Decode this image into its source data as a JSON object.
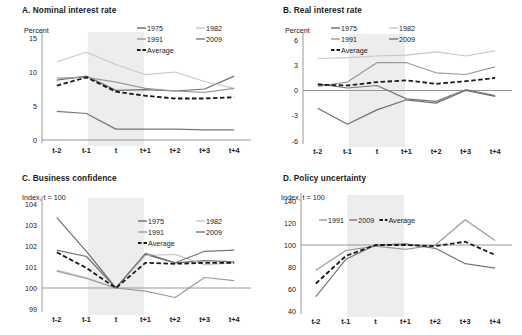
{
  "figure": {
    "xcats": [
      "t-2",
      "t-1",
      "t",
      "t+1",
      "t+2",
      "t+3",
      "t+4"
    ],
    "shading_note": "light gray band around period t",
    "colors": {
      "c1975": "#6e6e6e",
      "c1991": "#9a9a9a",
      "c1982": "#c8c8c8",
      "c2009": "#767676",
      "caverage": "#1a1a1a",
      "axis": "#8c8c8c",
      "band": "#ededed"
    }
  },
  "panels": [
    {
      "id": "A",
      "title": "A. Nominal interest rate",
      "unit": "Percent",
      "ylim": [
        0,
        15
      ],
      "yticks": [
        "0",
        "5",
        "10",
        "15"
      ],
      "ytickvals": [
        0,
        5,
        10,
        15
      ],
      "legend": [
        "1975",
        "1982",
        "1991",
        "2009",
        "Average"
      ],
      "chart_data": {
        "type": "line",
        "title": "A. Nominal interest rate",
        "xlabel": "",
        "ylabel": "Percent",
        "ylim": [
          0,
          15
        ],
        "grid": false,
        "legend_position": "top-right",
        "x": [
          "t-2",
          "t-1",
          "t",
          "t+1",
          "t+2",
          "t+3",
          "t+4"
        ],
        "series": [
          {
            "name": "1975",
            "values": [
              8.8,
              9.4,
              7.3,
              7.4,
              7.2,
              7.5,
              9.4
            ]
          },
          {
            "name": "1982",
            "values": [
              11.5,
              12.9,
              11.1,
              9.6,
              10.0,
              8.6,
              7.6
            ]
          },
          {
            "name": "1991",
            "values": [
              9.1,
              9.2,
              8.5,
              7.6,
              7.2,
              7.0,
              7.6
            ]
          },
          {
            "name": "2009",
            "values": [
              4.2,
              3.9,
              1.6,
              1.6,
              1.6,
              1.5,
              1.5
            ]
          },
          {
            "name": "Average",
            "values": [
              8.0,
              9.2,
              7.1,
              6.5,
              6.1,
              6.1,
              6.3
            ]
          }
        ]
      }
    },
    {
      "id": "B",
      "title": "B. Real interest rate",
      "unit": "Percent",
      "ylim": [
        -6,
        6
      ],
      "yticks": [
        "-6",
        "-3",
        "0",
        "3",
        "6"
      ],
      "ytickvals": [
        -6,
        -3,
        0,
        3,
        6
      ],
      "legend": [
        "1975",
        "1982",
        "1991",
        "2009",
        "Average"
      ],
      "chart_data": {
        "type": "line",
        "title": "B. Real interest rate",
        "xlabel": "",
        "ylabel": "Percent",
        "ylim": [
          -6,
          6
        ],
        "grid": false,
        "legend_position": "top-left",
        "x": [
          "t-2",
          "t-1",
          "t",
          "t+1",
          "t+2",
          "t+3",
          "t+4"
        ],
        "series": [
          {
            "name": "1975",
            "values": [
              -2.1,
              -4.0,
              -2.3,
              -1.1,
              -1.5,
              0.0,
              -0.7
            ]
          },
          {
            "name": "1982",
            "values": [
              3.8,
              3.9,
              4.1,
              4.2,
              4.6,
              4.1,
              4.7
            ]
          },
          {
            "name": "1991",
            "values": [
              0.5,
              1.0,
              3.3,
              3.3,
              2.1,
              1.9,
              2.8
            ]
          },
          {
            "name": "2009",
            "values": [
              0.8,
              0.3,
              0.6,
              -1.0,
              -1.3,
              0.1,
              -0.6
            ]
          },
          {
            "name": "Average",
            "values": [
              0.7,
              0.6,
              1.0,
              1.2,
              0.8,
              1.1,
              1.5
            ]
          }
        ]
      }
    },
    {
      "id": "C",
      "title": "C. Business confidence",
      "unit": "Index, t = 100",
      "ylim": [
        99,
        104
      ],
      "yticks": [
        "99",
        "100",
        "101",
        "102",
        "103",
        "104"
      ],
      "ytickvals": [
        99,
        100,
        101,
        102,
        103,
        104
      ],
      "legend": [
        "1975",
        "1982",
        "1991",
        "2009",
        "Average"
      ],
      "chart_data": {
        "type": "line",
        "title": "C. Business confidence",
        "xlabel": "",
        "ylabel": "Index, t = 100",
        "ylim": [
          99,
          104
        ],
        "grid": false,
        "legend_position": "top-right",
        "x": [
          "t-2",
          "t-1",
          "t",
          "t+1",
          "t+2",
          "t+3",
          "t+4"
        ],
        "series": [
          {
            "name": "1975",
            "values": [
              103.35,
              101.75,
              100.0,
              101.6,
              101.2,
              101.3,
              101.25
            ]
          },
          {
            "name": "1982",
            "values": [
              100.85,
              100.5,
              100.0,
              101.55,
              101.6,
              101.1,
              101.2
            ]
          },
          {
            "name": "1991",
            "values": [
              100.8,
              100.45,
              100.0,
              99.85,
              99.55,
              100.5,
              100.35
            ]
          },
          {
            "name": "2009",
            "values": [
              101.8,
              101.5,
              100.0,
              101.65,
              101.2,
              101.75,
              101.8
            ]
          },
          {
            "name": "Average",
            "values": [
              101.7,
              100.95,
              100.0,
              101.2,
              101.15,
              101.2,
              101.2
            ]
          }
        ]
      }
    },
    {
      "id": "D",
      "title": "D. Policy uncertainty",
      "unit": "Index, t = 100",
      "ylim": [
        40,
        140
      ],
      "yticks": [
        "40",
        "60",
        "80",
        "100",
        "120",
        "140"
      ],
      "ytickvals": [
        40,
        60,
        80,
        100,
        120,
        140
      ],
      "legend": [
        "1991",
        "2009",
        "Average"
      ],
      "chart_data": {
        "type": "line",
        "title": "D. Policy uncertainty",
        "xlabel": "",
        "ylabel": "Index, t = 100",
        "ylim": [
          40,
          140
        ],
        "grid": false,
        "legend_position": "top-left",
        "x": [
          "t-2",
          "t-1",
          "t",
          "t+1",
          "t+2",
          "t+3",
          "t+4"
        ],
        "series": [
          {
            "name": "1991",
            "values": [
              77,
              95,
              99,
              96,
              100,
              123,
              104
            ]
          },
          {
            "name": "2009",
            "values": [
              53,
              87,
              100,
              101,
              97,
              83,
              79
            ]
          },
          {
            "name": "Average",
            "values": [
              65,
              90,
              100,
              100,
              99,
              103,
              91
            ]
          }
        ]
      }
    }
  ]
}
